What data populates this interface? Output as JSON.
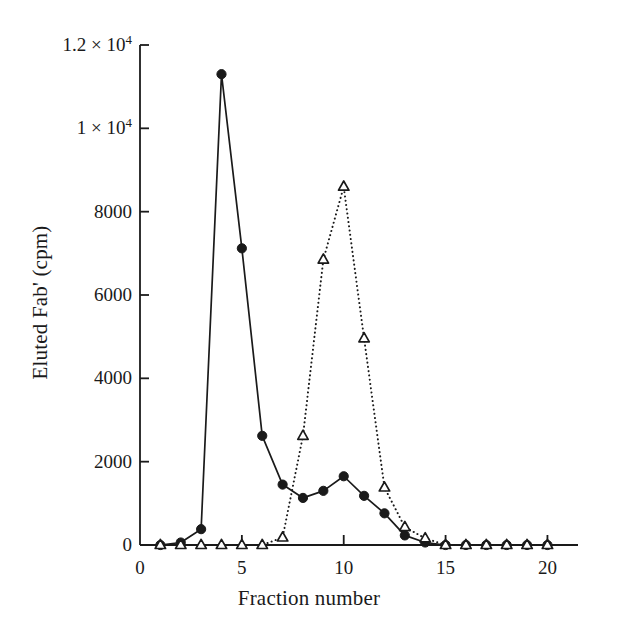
{
  "figure": {
    "background_color": "#ffffff",
    "ink_color": "#1a1a1a"
  },
  "chart_data": {
    "type": "line",
    "title": "",
    "subtitle": "",
    "xlabel": "Fraction number",
    "ylabel": "Eluted Fab' (cpm)",
    "xlim": [
      0,
      21.5
    ],
    "ylim": [
      0,
      12000
    ],
    "grid": false,
    "legend": "none",
    "xticks": [
      0,
      5,
      10,
      15,
      20
    ],
    "xtick_labels": [
      "0",
      "5",
      "10",
      "15",
      "20"
    ],
    "yticks": [
      0,
      2000,
      4000,
      6000,
      8000,
      10000,
      12000
    ],
    "ytick_labels": [
      "0",
      "2000",
      "4000",
      "6000",
      "8000",
      "1 × 10",
      "1.2 × 10"
    ],
    "ytick_label_exponent": "4",
    "x": [
      1,
      2,
      3,
      4,
      5,
      6,
      7,
      8,
      9,
      10,
      11,
      12,
      13,
      14,
      15,
      16,
      17,
      18,
      19,
      20
    ],
    "series": [
      {
        "name": "filled-circle-series",
        "marker": "filled-circle",
        "line_style": "solid",
        "color": "#1a1a1a",
        "values": [
          0,
          60,
          380,
          11300,
          7120,
          2620,
          1450,
          1130,
          1300,
          1650,
          1180,
          760,
          230,
          60,
          0,
          0,
          0,
          0,
          0,
          0
        ]
      },
      {
        "name": "open-triangle-series",
        "marker": "open-triangle",
        "line_style": "dotted",
        "color": "#1a1a1a",
        "values": [
          0,
          0,
          0,
          0,
          0,
          0,
          180,
          2620,
          6850,
          8600,
          4960,
          1380,
          430,
          160,
          0,
          0,
          0,
          0,
          0,
          0
        ]
      }
    ]
  }
}
